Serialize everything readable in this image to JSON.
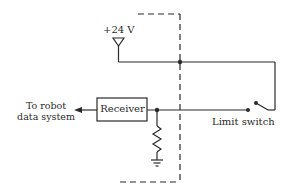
{
  "diagram": {
    "supply_label": "+24 V",
    "output_label_line1": "To robot",
    "output_label_line2": "data system",
    "receiver_label": "Receiver",
    "switch_label": "Limit switch",
    "components": [
      "+24 V supply",
      "Receiver",
      "Pull-down resistor",
      "Ground",
      "Limit switch",
      "Dashed enclosure boundary"
    ],
    "colors": {
      "line": "#2a2a2a",
      "background": "#ffffff"
    }
  }
}
